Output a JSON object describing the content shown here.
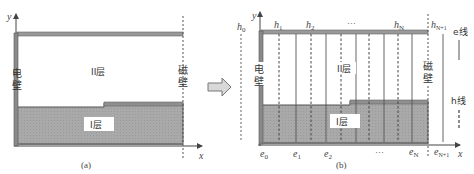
{
  "panel_a": {
    "caption": "(a)",
    "axis_x": "x",
    "axis_y": "y",
    "left_wall_label": [
      "电",
      "壁"
    ],
    "right_wall_label": [
      "磁",
      "壁"
    ],
    "layer_upper": "II层",
    "layer_lower": "I层"
  },
  "arrow": {
    "icon": "right-arrow-icon"
  },
  "panel_b": {
    "caption": "(b)",
    "axis_x": "x",
    "axis_y": "y",
    "left_wall_label": [
      "电",
      "壁"
    ],
    "right_wall_label": [
      "磁",
      "壁"
    ],
    "layer_upper": "II层",
    "layer_lower": "I层",
    "h_labels": {
      "h0": "h",
      "h0_sub": "0",
      "h1": "h",
      "h1_sub": "1",
      "h2": "h",
      "h2_sub": "2",
      "dots_top": "···",
      "hN": "h",
      "hN_sub": "N",
      "hN1": "h",
      "hN1_sub": "N+1"
    },
    "e_labels": {
      "e0": "e",
      "e0_sub": "0",
      "e1": "e",
      "e1_sub": "1",
      "e2": "e",
      "e2_sub": "2",
      "dots_bottom": "···",
      "eN": "e",
      "eN_sub": "N",
      "eN1": "e",
      "eN1_sub": "N+1"
    },
    "legend": {
      "e_line": "e线",
      "h_line": "h线"
    }
  },
  "colors": {
    "layer_fill": "#a6a6a6",
    "wall": "#7a7a7a",
    "line": "#555555",
    "label_bg": "#ffffff"
  }
}
